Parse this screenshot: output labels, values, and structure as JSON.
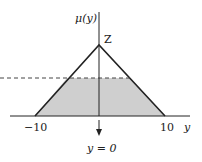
{
  "diagram": {
    "type": "membership-function",
    "shape": "triangle",
    "y_axis_label": "μ(y)",
    "x_axis_label": "y",
    "apex_label": "Z",
    "x_ticks": [
      {
        "label": "−10",
        "value": -10
      },
      {
        "label": "10",
        "value": 10
      }
    ],
    "arrow_label": "y = 0",
    "cut_level": "dashed horizontal line (alpha cut) with shaded trapezoid below",
    "colors": {
      "line": "#222222",
      "fill": "#cfcfcf",
      "dash": "#444444"
    }
  }
}
